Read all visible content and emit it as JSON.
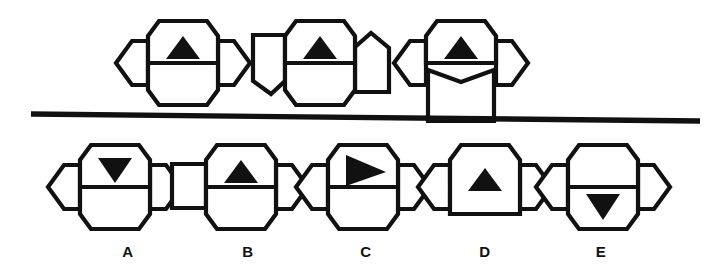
{
  "page": {
    "type": "abstract-reasoning-puzzle",
    "width": 721,
    "height": 278,
    "background_color": "#ffffff",
    "ink_color": "#111111"
  },
  "divider": {
    "name": "horizontal-divider-line",
    "x1": 31,
    "y1": 114,
    "x2": 700,
    "y2": 121,
    "thickness": 5.4,
    "color": "#111111"
  },
  "prompt_row": {
    "label": "",
    "figures": [
      {
        "id": "prompt-1",
        "origin_x": 128,
        "origin_y": 18,
        "center_x": 55,
        "center_y": 45,
        "parts": {
          "center": {
            "shape": "vertical-hexagon",
            "split": true,
            "points": "31,3 79,3 90,18 90,72 79,87 31,87 20,72 20,18",
            "split_line": {
              "x1": 20,
              "y1": 45,
              "x2": 90,
              "y2": 45
            }
          },
          "left": {
            "shape": "horizontal-hexagon-pointed-left",
            "points": "20,23 20,67 4,67 -12,45 4,23"
          },
          "right": {
            "shape": "horizontal-hexagon-pointed-right",
            "points": "90,23 90,67 106,67 122,45 106,23"
          },
          "bottom": {
            "shape": "merged-into-center",
            "present": true
          }
        },
        "marker": {
          "glyph": "triangle-up",
          "cell": "top",
          "points": "55,18 72,41 38,41"
        }
      },
      {
        "id": "prompt-2",
        "origin_x": 265,
        "origin_y": 18,
        "center_x": 55,
        "center_y": 45,
        "parts": {
          "center": {
            "shape": "vertical-hexagon",
            "split": true,
            "points": "31,3 79,3 90,18 90,72 79,87 31,87 20,72 20,18",
            "split_line": {
              "x1": 20,
              "y1": 45,
              "x2": 90,
              "y2": 45
            }
          },
          "left": {
            "shape": "irregular-pentagon-point-down",
            "points": "20,17 20,63 6,76 -12,63 -12,17"
          },
          "right": {
            "shape": "irregular-pentagon-house",
            "points": "90,29 106,15 124,30 124,74 90,74"
          }
        },
        "marker": {
          "glyph": "triangle-up",
          "cell": "top",
          "points": "55,18 72,41 38,41"
        }
      },
      {
        "id": "prompt-3",
        "origin_x": 406,
        "origin_y": 18,
        "center_x": 55,
        "center_y": 45,
        "parts": {
          "center_top": {
            "shape": "vertical-hexagon-top-half",
            "points": "31,3 79,3 90,18 90,45 20,45 20,18",
            "split_line": {
              "x1": 20,
              "y1": 45,
              "x2": 90,
              "y2": 45
            }
          },
          "bottom": {
            "shape": "rectangle-with-notched-top",
            "points": "22,52 55,64 88,52 88,103 22,103"
          },
          "left": {
            "shape": "horizontal-hexagon-pointed-left",
            "points": "20,23 20,67 4,67 -12,45 4,23"
          },
          "right": {
            "shape": "horizontal-hexagon-pointed-right",
            "points": "90,23 90,67 106,67 122,45 106,23"
          }
        },
        "marker": {
          "glyph": "triangle-up",
          "cell": "top",
          "points": "55,18 72,41 38,41"
        }
      }
    ]
  },
  "options_row": {
    "options": [
      {
        "id": "option-a",
        "label": "A",
        "label_x": 128,
        "label_y": 243,
        "origin_x": 60,
        "origin_y": 142,
        "parts": {
          "center": {
            "shape": "vertical-hexagon",
            "split": true,
            "points": "31,3 79,3 90,18 90,72 79,87 31,87 20,72 20,18",
            "split_line": {
              "x1": 20,
              "y1": 45,
              "x2": 90,
              "y2": 45
            }
          },
          "left": {
            "shape": "horizontal-hexagon-pointed-left",
            "points": "20,23 20,67 4,67 -12,45 4,23"
          },
          "right": {
            "shape": "horizontal-hexagon-pointed-right",
            "points": "90,23 90,67 106,67 122,45 106,23"
          }
        },
        "marker": {
          "glyph": "triangle-down",
          "cell": "top",
          "points": "38,16 72,16 55,41"
        }
      },
      {
        "id": "option-b",
        "label": "B",
        "label_x": 248,
        "label_y": 243,
        "origin_x": 184,
        "origin_y": 142,
        "parts": {
          "center": {
            "shape": "vertical-hexagon",
            "split": true,
            "points": "31,3 79,3 90,18 90,72 79,87 31,87 20,72 20,18",
            "split_line": {
              "x1": 20,
              "y1": 45,
              "x2": 90,
              "y2": 45
            }
          },
          "left": {
            "shape": "square-irregular",
            "points": "20,22 20,66 -14,66 -14,22"
          },
          "right": {
            "shape": "horizontal-hexagon-pointed-right",
            "points": "90,23 90,67 106,67 122,45 106,23"
          }
        },
        "marker": {
          "glyph": "triangle-up",
          "cell": "top",
          "points": "55,18 72,41 38,41"
        }
      },
      {
        "id": "option-c",
        "label": "C",
        "label_x": 366,
        "label_y": 243,
        "origin_x": 308,
        "origin_y": 142,
        "parts": {
          "center": {
            "shape": "vertical-hexagon",
            "split": true,
            "points": "31,3 79,3 90,18 90,72 79,87 31,87 20,72 20,18",
            "split_line": {
              "x1": 20,
              "y1": 45,
              "x2": 90,
              "y2": 45
            }
          },
          "left": {
            "shape": "horizontal-hexagon-pointed-left",
            "points": "20,23 20,67 4,67 -12,45 4,23"
          },
          "right": {
            "shape": "horizontal-hexagon-pointed-right",
            "points": "90,23 90,67 106,67 122,45 106,23"
          }
        },
        "marker": {
          "glyph": "triangle-right",
          "cell": "top",
          "points": "38,13 78,30 38,44"
        }
      },
      {
        "id": "option-d",
        "label": "D",
        "label_x": 485,
        "label_y": 243,
        "origin_x": 430,
        "origin_y": 142,
        "parts": {
          "center_top": {
            "shape": "vertical-hexagon-top-half-only",
            "points": "31,3 79,3 90,18 90,72 20,72 20,18"
          },
          "left": {
            "shape": "horizontal-hexagon-pointed-left",
            "points": "20,23 20,67 4,67 -12,45 4,23"
          },
          "right": {
            "shape": "horizontal-hexagon-pointed-right",
            "points": "90,23 90,67 106,67 122,45 106,23"
          },
          "bottom": {
            "shape": "none",
            "present": false
          }
        },
        "marker": {
          "glyph": "triangle-up",
          "cell": "top",
          "points": "55,26 72,49 38,49"
        }
      },
      {
        "id": "option-e",
        "label": "E",
        "label_x": 601,
        "label_y": 243,
        "origin_x": 548,
        "origin_y": 142,
        "parts": {
          "center": {
            "shape": "vertical-hexagon",
            "split": true,
            "points": "31,3 79,3 90,18 90,72 79,87 31,87 20,72 20,18",
            "split_line": {
              "x1": 20,
              "y1": 45,
              "x2": 90,
              "y2": 45
            }
          },
          "left": {
            "shape": "horizontal-hexagon-pointed-left",
            "points": "20,23 20,67 4,67 -12,45 4,23"
          },
          "right": {
            "shape": "horizontal-hexagon-pointed-right",
            "points": "90,23 90,67 106,67 122,45 106,23"
          }
        },
        "marker": {
          "glyph": "triangle-down",
          "cell": "bottom",
          "points": "38,52 72,52 55,78"
        }
      }
    ]
  }
}
